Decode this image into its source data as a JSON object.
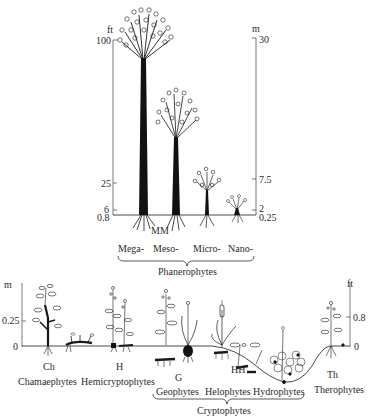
{
  "top_panel": {
    "left_axis": {
      "unit": "ft",
      "ticks": [
        "100",
        "25",
        "6",
        "0.8"
      ]
    },
    "right_axis": {
      "unit": "m",
      "ticks": [
        "30",
        "7.5",
        "2",
        "0.25"
      ]
    },
    "bud_marker": "MM",
    "categories": [
      "Mega-",
      "Meso-",
      "Micro-",
      "Nano-"
    ],
    "group_label": "Phanerophytes"
  },
  "bottom_panel": {
    "left_axis": {
      "unit": "m",
      "ticks": [
        "0.25",
        "0"
      ]
    },
    "right_axis": {
      "unit": "ft",
      "ticks": [
        "0.8",
        "0"
      ]
    },
    "codes": {
      "ch": "Ch",
      "h": "H",
      "g": "G",
      "hh": "HH",
      "th": "Th"
    },
    "life_forms": {
      "chamaephytes": "Chamaephytes",
      "hemicryptophytes": "Hemicryptophytes",
      "geophytes": "Geophytes",
      "helophytes": "Helophytes",
      "hydrophytes": "Hydrophytes",
      "therophytes": "Therophytes"
    },
    "group_label": "Cryptophytes"
  },
  "colors": {
    "ink": "#1a1a1a",
    "axis": "#555555",
    "background": "#ffffff"
  }
}
